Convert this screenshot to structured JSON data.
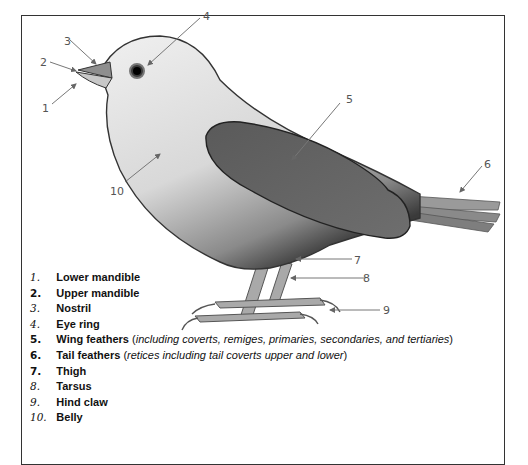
{
  "diagram": {
    "callouts": [
      "1",
      "2",
      "3",
      "4",
      "5",
      "6",
      "7",
      "8",
      "9",
      "10"
    ],
    "legend": [
      {
        "num": "1.",
        "italic_num": true,
        "label": "Lower mandible"
      },
      {
        "num": "2.",
        "italic_num": false,
        "label": "Upper mandible"
      },
      {
        "num": "3.",
        "italic_num": true,
        "label": "Nostril"
      },
      {
        "num": "4.",
        "italic_num": true,
        "label": "Eye ring"
      },
      {
        "num": "5.",
        "italic_num": false,
        "label": "Wing feathers",
        "open": " (",
        "detail": "including coverts, remiges, primaries, secondaries, and tertiaries",
        "close": ")"
      },
      {
        "num": "6.",
        "italic_num": false,
        "label": "Tail feathers",
        "open": " (",
        "detail": "retices including tail coverts upper and lower",
        "close": ")"
      },
      {
        "num": "7.",
        "italic_num": false,
        "label": "Thigh"
      },
      {
        "num": "8.",
        "italic_num": true,
        "label": "Tarsus"
      },
      {
        "num": "9.",
        "italic_num": true,
        "label": "Hind claw"
      },
      {
        "num": "10.",
        "italic_num": true,
        "label": "Belly"
      }
    ]
  }
}
